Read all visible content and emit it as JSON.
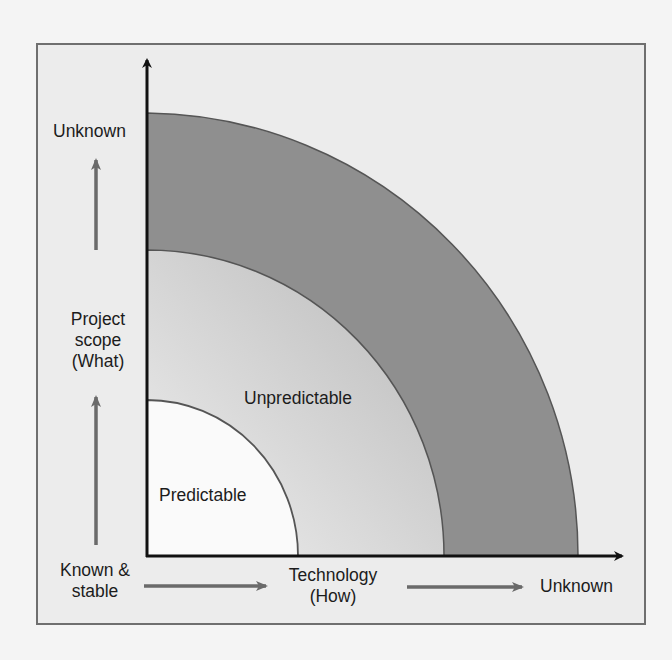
{
  "diagram": {
    "type": "concentric-quarter-arcs",
    "y_axis": {
      "title_lines": [
        "Project",
        "scope",
        "(What)"
      ],
      "high_label": "Unknown",
      "low_label_lines": [
        "Known &",
        "stable"
      ]
    },
    "x_axis": {
      "title_lines": [
        "Technology",
        "(How)"
      ],
      "high_label": "Unknown"
    },
    "regions": [
      {
        "name": "Predictable",
        "label": "Predictable",
        "fill": "#fafafa"
      },
      {
        "name": "Unpredictable",
        "label": "Unpredictable",
        "fill": "#c9c9c9"
      },
      {
        "name": "Outer band",
        "label": "",
        "fill": "#8f8f8f"
      }
    ],
    "colors": {
      "frame_border": "#6f6f6f",
      "frame_background": "#ececec",
      "axis": "#111111",
      "guide_arrow": "#6a6a6a",
      "arc_stroke": "#555555"
    }
  }
}
